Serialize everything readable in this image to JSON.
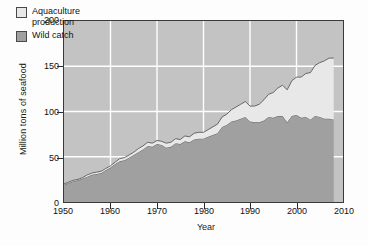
{
  "chart_data": {
    "type": "area",
    "stacked": true,
    "title": "",
    "xlabel": "Year",
    "ylabel": "Million tons of seafood",
    "xlim": [
      1950,
      2010
    ],
    "ylim": [
      0,
      200
    ],
    "xticks": [
      1950,
      1960,
      1970,
      1980,
      1990,
      2000,
      2010
    ],
    "yticks": [
      0,
      50,
      100,
      150,
      200
    ],
    "grid": true,
    "grid_color": "#ffffff",
    "plot_background": "#c3c3c3",
    "legend_position": "top-left",
    "x": [
      1950,
      1951,
      1952,
      1953,
      1954,
      1955,
      1956,
      1957,
      1958,
      1959,
      1960,
      1961,
      1962,
      1963,
      1964,
      1965,
      1966,
      1967,
      1968,
      1969,
      1970,
      1971,
      1972,
      1973,
      1974,
      1975,
      1976,
      1977,
      1978,
      1979,
      1980,
      1981,
      1982,
      1983,
      1984,
      1985,
      1986,
      1987,
      1988,
      1989,
      1990,
      1991,
      1992,
      1993,
      1994,
      1995,
      1996,
      1997,
      1998,
      1999,
      2000,
      2001,
      2002,
      2003,
      2004,
      2005,
      2006,
      2007,
      2008
    ],
    "series": [
      {
        "name": "Wild catch",
        "color": "#a0a0a0",
        "values": [
          19,
          21,
          23,
          24,
          26,
          28,
          30,
          31,
          32,
          35,
          38,
          42,
          45,
          46,
          49,
          52,
          55,
          58,
          62,
          61,
          64,
          63,
          60,
          61,
          65,
          64,
          67,
          66,
          69,
          70,
          70,
          72,
          74,
          76,
          83,
          85,
          89,
          90,
          92,
          94,
          89,
          88,
          88,
          90,
          94,
          93,
          95,
          95,
          88,
          95,
          96,
          93,
          94,
          91,
          95,
          94,
          92,
          92,
          91
        ]
      },
      {
        "name": "Aquaculture production",
        "color": "#e8e8e8",
        "values": [
          1,
          1,
          1,
          1,
          1,
          2,
          2,
          2,
          2,
          2,
          2,
          2,
          3,
          3,
          3,
          3,
          4,
          4,
          4,
          4,
          4,
          4,
          5,
          5,
          5,
          5,
          6,
          6,
          7,
          7,
          7,
          8,
          9,
          10,
          11,
          12,
          13,
          15,
          16,
          17,
          17,
          18,
          20,
          23,
          25,
          28,
          31,
          34,
          36,
          39,
          42,
          45,
          48,
          52,
          56,
          60,
          64,
          67,
          68
        ]
      }
    ],
    "total_note_values": [
      20,
      22,
      24,
      25,
      27,
      30,
      32,
      33,
      34,
      37,
      40,
      44,
      48,
      49,
      52,
      55,
      59,
      62,
      66,
      65,
      68,
      67,
      65,
      66,
      70,
      69,
      73,
      72,
      76,
      77,
      77,
      80,
      83,
      86,
      94,
      97,
      102,
      105,
      108,
      111,
      106,
      106,
      108,
      113,
      119,
      121,
      126,
      129,
      124,
      134,
      138,
      138,
      142,
      143,
      151,
      154,
      156,
      159,
      159
    ]
  },
  "legend": {
    "items": [
      {
        "label_line1": "Aquaculture",
        "label_line2": "production",
        "swatch": "aquaculture-swatch"
      },
      {
        "label_line1": "Wild catch",
        "label_line2": "",
        "swatch": "wild-catch-swatch"
      }
    ]
  },
  "axes": {
    "ytick_labels": [
      "200",
      "150",
      "100",
      "50",
      "0"
    ],
    "xtick_labels": [
      "1950",
      "1960",
      "1970",
      "1980",
      "1990",
      "2000",
      "2010"
    ],
    "ylabel": "Million tons of seafood",
    "xlabel": "Year"
  }
}
